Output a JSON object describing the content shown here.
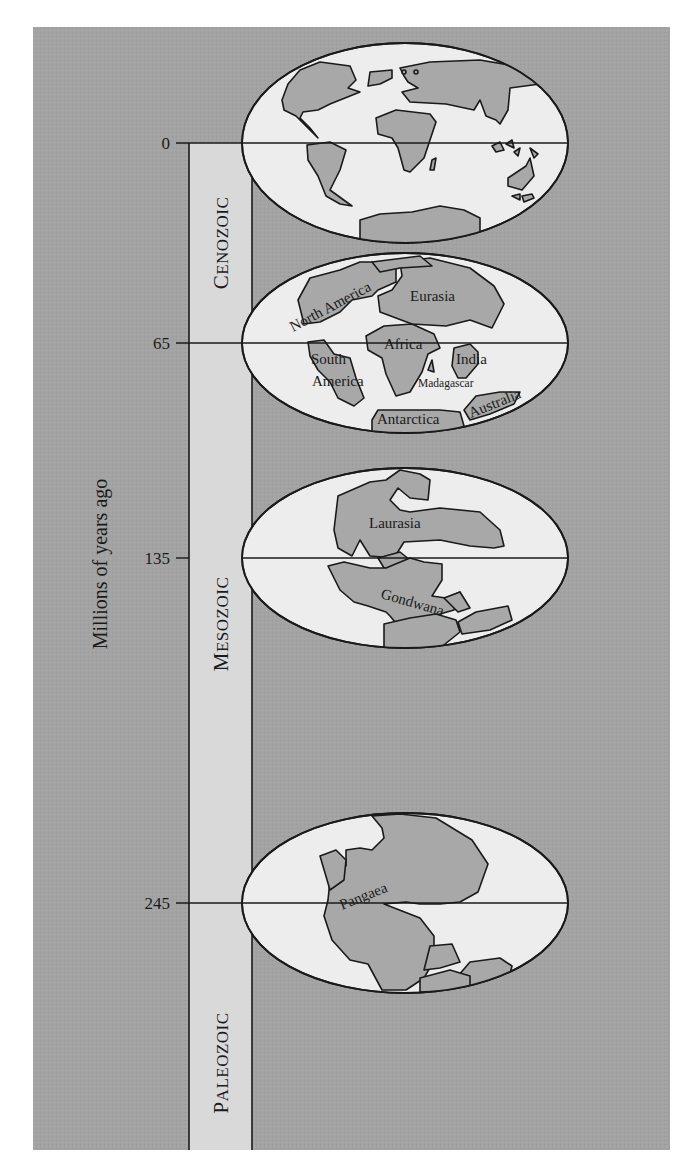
{
  "figure": {
    "axis_title": "Millions of years ago",
    "colors": {
      "panel_background": "#a3a3a3",
      "era_band": "#d9d9d9",
      "ocean": "#ededed",
      "land": "#a8a8a8",
      "outline": "#1a1a1a"
    },
    "ticks": [
      {
        "label": "0",
        "value": 0
      },
      {
        "label": "65",
        "value": 65
      },
      {
        "label": "135",
        "value": 135
      },
      {
        "label": "245",
        "value": 245
      }
    ],
    "eras": [
      {
        "cap": "C",
        "rest": "ENOZOIC",
        "name": "Cenozoic"
      },
      {
        "cap": "M",
        "rest": "ESOZOIC",
        "name": "Mesozoic"
      },
      {
        "cap": "P",
        "rest": "ALEOZOIC",
        "name": "Paleozoic"
      }
    ],
    "globes": [
      {
        "age": "0",
        "labels": []
      },
      {
        "age": "65",
        "labels": [
          "North America",
          "Eurasia",
          "Africa",
          "South",
          "America",
          "India",
          "Madagascar",
          "Antarctica",
          "Australia"
        ]
      },
      {
        "age": "135",
        "labels": [
          "Laurasia",
          "Gondwana"
        ]
      },
      {
        "age": "245",
        "labels": [
          "Pangaea"
        ]
      }
    ]
  }
}
